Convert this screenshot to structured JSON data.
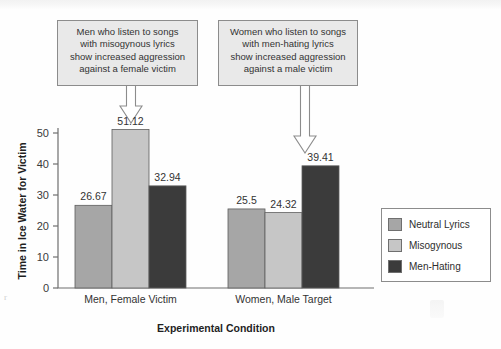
{
  "chart_data": {
    "type": "bar",
    "title": "",
    "xlabel": "Experimental Condition",
    "ylabel": "Time in Ice Water for Victim",
    "categories": [
      "Men, Female Victim",
      "Women, Male Target"
    ],
    "series": [
      {
        "name": "Neutral Lyrics",
        "color": "#a6a6a6",
        "values": [
          26.67,
          25.5
        ]
      },
      {
        "name": "Misogynous",
        "color": "#c6c6c6",
        "values": [
          51.12,
          24.32
        ]
      },
      {
        "name": "Men-Hating",
        "color": "#3b3b3b",
        "values": [
          32.94,
          39.41
        ]
      }
    ],
    "ylim": [
      0,
      50
    ],
    "yticks": [
      0,
      10,
      20,
      30,
      40,
      50
    ],
    "ytick_labels": [
      "0",
      "10",
      "20",
      "30",
      "40",
      "50"
    ],
    "grid": false,
    "legend_position": "right",
    "value_labels": [
      "26.67",
      "51.12",
      "32.94",
      "25.5",
      "24.32",
      "39.41"
    ]
  },
  "annotations": [
    {
      "id": "callout-left",
      "lines": [
        "Men who listen to songs",
        "with misogynous lyrics",
        "show increased aggression",
        "against a female victim"
      ],
      "points_to": "Misogynous bar, Men, Female Victim (51.12)"
    },
    {
      "id": "callout-right",
      "lines": [
        "Women who listen to songs",
        "with men-hating lyrics",
        "show increased aggression",
        "against a male victim"
      ],
      "points_to": "Men-Hating bar, Women, Male Target (39.41)"
    }
  ],
  "legend": {
    "items": [
      {
        "label": "Neutral Lyrics",
        "color": "#a6a6a6"
      },
      {
        "label": "Misogynous",
        "color": "#c6c6c6"
      },
      {
        "label": "Men-Hating",
        "color": "#3b3b3b"
      }
    ]
  },
  "colors": {
    "neutral_lyrics": "#a6a6a6",
    "misogynous": "#c6c6c6",
    "men_hating": "#3b3b3b",
    "callout_fill": "#e9e9e9",
    "callout_border": "#8c8c8c",
    "axis": "#6e6e6e",
    "background": "#fefefe"
  }
}
